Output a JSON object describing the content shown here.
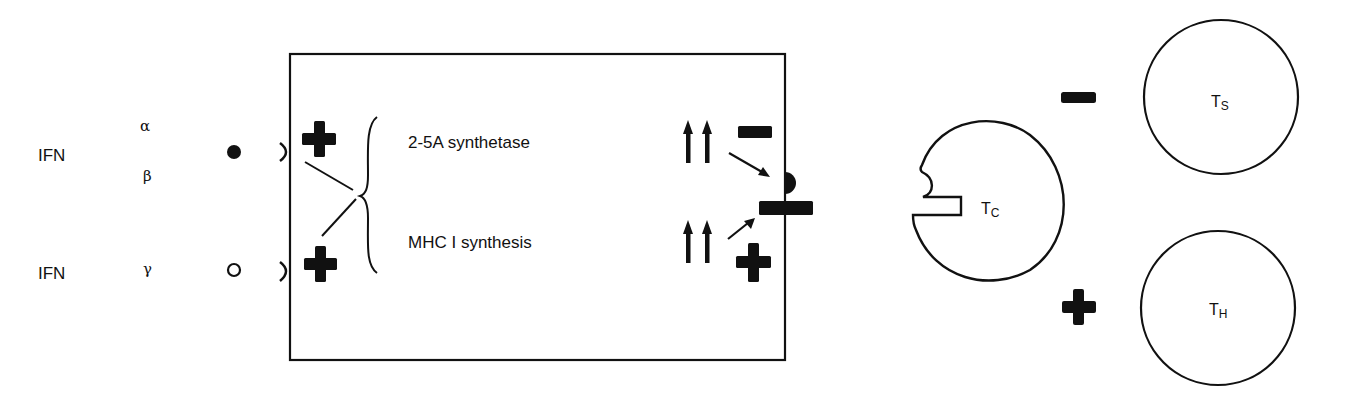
{
  "ligands": [
    {
      "name": "IFN",
      "subtypes": [
        "α",
        "β"
      ],
      "receptor_marker": "filled-circle"
    },
    {
      "name": "IFN",
      "subtypes": [
        "γ"
      ],
      "receptor_marker": "open-circle"
    }
  ],
  "cell": {
    "effects_on_entry": [
      "+",
      "+"
    ],
    "processes": [
      {
        "label": "2-5A synthetase",
        "change": "↑↑",
        "effect": "−"
      },
      {
        "label": "MHC I synthesis",
        "change": "↑↑",
        "effect": "+"
      }
    ]
  },
  "t_cells": [
    {
      "base": "T",
      "sub": "C",
      "role": "cytotoxic"
    },
    {
      "base": "T",
      "sub": "S",
      "role": "suppressor",
      "effect": "−"
    },
    {
      "base": "T",
      "sub": "H",
      "role": "helper",
      "effect": "+"
    }
  ],
  "colors": {
    "ink": "#111111",
    "background": "#ffffff"
  }
}
